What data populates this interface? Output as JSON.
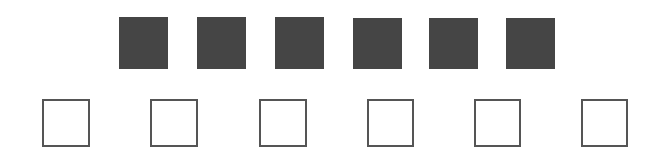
{
  "tiles": {
    "color": "#454545",
    "items": [
      {
        "x": 119,
        "y": 17,
        "w": 49,
        "h": 52
      },
      {
        "x": 197,
        "y": 17,
        "w": 49,
        "h": 52
      },
      {
        "x": 275,
        "y": 17,
        "w": 49,
        "h": 52
      },
      {
        "x": 353,
        "y": 18,
        "w": 49,
        "h": 51
      },
      {
        "x": 429,
        "y": 18,
        "w": 49,
        "h": 51
      },
      {
        "x": 506,
        "y": 18,
        "w": 49,
        "h": 51
      }
    ]
  },
  "slots": {
    "border_color": "#555555",
    "fill_color": "#ffffff",
    "items": [
      {
        "x": 42,
        "y": 99,
        "w": 48,
        "h": 48
      },
      {
        "x": 150,
        "y": 99,
        "w": 48,
        "h": 48
      },
      {
        "x": 259,
        "y": 99,
        "w": 48,
        "h": 48
      },
      {
        "x": 367,
        "y": 99,
        "w": 47,
        "h": 48
      },
      {
        "x": 474,
        "y": 99,
        "w": 47,
        "h": 48
      },
      {
        "x": 581,
        "y": 99,
        "w": 47,
        "h": 48
      }
    ]
  }
}
